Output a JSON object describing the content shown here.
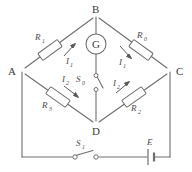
{
  "diagram": {
    "background_color": "#ffffff",
    "line_color": "#6e6e6e",
    "text_color": "#4a4a4a"
  },
  "nodes": [
    {
      "id": "A",
      "label": "A",
      "x": 16,
      "y": 71
    },
    {
      "id": "B",
      "label": "B",
      "x": 96,
      "y": 10
    },
    {
      "id": "C",
      "label": "C",
      "x": 176,
      "y": 71
    },
    {
      "id": "D",
      "label": "D",
      "x": 96,
      "y": 126
    }
  ],
  "components": {
    "r_top_left": {
      "name": "R",
      "subscript": "1",
      "branch": "A-B"
    },
    "r_top_right": {
      "name": "R",
      "subscript": "0",
      "branch": "B-C"
    },
    "r_bottom_left": {
      "name": "R",
      "subscript": "3",
      "branch": "A-D"
    },
    "r_bottom_right": {
      "name": "R",
      "subscript": "2",
      "branch": "D-C"
    },
    "galvanometer": {
      "name": "G",
      "branch": "B-D"
    },
    "switch_bridge": {
      "name": "S",
      "subscript": "0",
      "branch": "B-D",
      "state": "open"
    },
    "switch_main": {
      "name": "S",
      "subscript": "1",
      "branch": "A-C outer",
      "state": "open"
    },
    "battery": {
      "name": "E",
      "branch": "A-C outer"
    }
  },
  "currents": [
    {
      "name": "I",
      "subscript": "1",
      "branch": "A-B"
    },
    {
      "name": "I",
      "subscript": "1",
      "branch": "B-C"
    },
    {
      "name": "I",
      "subscript": "2",
      "branch": "A-D"
    },
    {
      "name": "I",
      "subscript": "2",
      "branch": "D-C"
    }
  ]
}
